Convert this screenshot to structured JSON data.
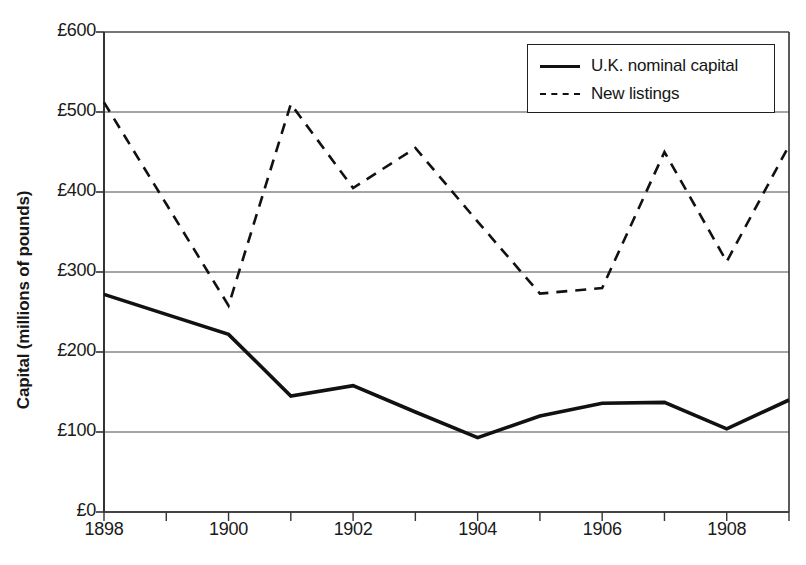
{
  "chart_data": {
    "type": "line",
    "title": "",
    "xlabel": "",
    "ylabel": "Capital (millions of pounds)",
    "x": [
      1898,
      1899,
      1900,
      1901,
      1902,
      1903,
      1904,
      1905,
      1906,
      1907,
      1908,
      1909
    ],
    "xlim": [
      1898,
      1909
    ],
    "ylim": [
      0,
      600
    ],
    "ytick_values": [
      0,
      100,
      200,
      300,
      400,
      500,
      600
    ],
    "ytick_labels": [
      "£0",
      "£100",
      "£200",
      "£300",
      "£400",
      "£500",
      "£600"
    ],
    "xtick_values": [
      1898,
      1900,
      1902,
      1904,
      1906,
      1908
    ],
    "xtick_labels": [
      "1898",
      "1900",
      "1902",
      "1904",
      "1906",
      "1908"
    ],
    "grid": "horizontal",
    "legend_position": "top-right",
    "series": [
      {
        "name": "U.K. nominal capital",
        "style": "solid",
        "color": "#111111",
        "values": [
          272,
          247,
          222,
          145,
          158,
          125,
          93,
          120,
          136,
          137,
          104,
          140
        ]
      },
      {
        "name": "New listings",
        "style": "dashed",
        "color": "#111111",
        "values": [
          512,
          385,
          258,
          510,
          405,
          455,
          363,
          273,
          280,
          450,
          313,
          458
        ]
      }
    ]
  },
  "axes": {
    "y_title": "Capital (millions of pounds)"
  },
  "legend": {
    "entries": [
      {
        "label": "U.K. nominal capital",
        "style": "solid"
      },
      {
        "label": "New listings",
        "style": "dashed"
      }
    ]
  }
}
